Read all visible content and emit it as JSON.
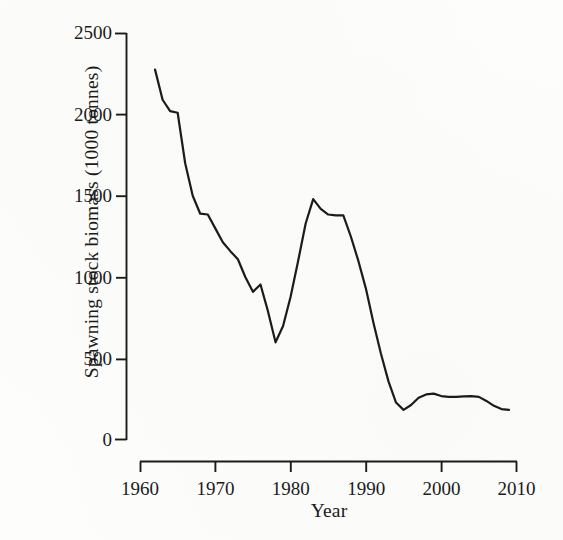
{
  "figure": {
    "background_color": "#fdfdfc",
    "ink_color": "#1b1b1b"
  },
  "axes": {
    "x": {
      "label": "Year",
      "ticks": [
        "1960",
        "1970",
        "1980",
        "1990",
        "2000",
        "2010"
      ],
      "tick_values": [
        1960,
        1970,
        1980,
        1990,
        2000,
        2010
      ],
      "range": [
        1960,
        2010
      ]
    },
    "y": {
      "label": "Spawning stock biomass (1000 tonnes)",
      "ticks": [
        "0",
        "500",
        "1000",
        "1500",
        "2000",
        "2500"
      ],
      "tick_values": [
        0,
        500,
        1000,
        1500,
        2000,
        2500
      ],
      "range": [
        0,
        2500
      ]
    }
  },
  "chart_data": {
    "type": "line",
    "title": "",
    "xlabel": "Year",
    "ylabel": "Spawning stock biomass (1000 tonnes)",
    "xlim": [
      1960,
      2010
    ],
    "ylim": [
      0,
      2500
    ],
    "grid": false,
    "legend": false,
    "line_color": "#1b1b1b",
    "line_width": 2.2,
    "series": [
      {
        "name": "Spawning stock biomass",
        "x": [
          1962,
          1963,
          1964,
          1965,
          1966,
          1967,
          1968,
          1969,
          1970,
          1971,
          1972,
          1973,
          1974,
          1975,
          1976,
          1977,
          1978,
          1979,
          1980,
          1981,
          1982,
          1983,
          1984,
          1985,
          1986,
          1987,
          1988,
          1989,
          1990,
          1991,
          1992,
          1993,
          1994,
          1995,
          1996,
          1997,
          1998,
          1999,
          2000,
          2001,
          2002,
          2003,
          2004,
          2005,
          2006,
          2007,
          2008,
          2009
        ],
        "values": [
          2275,
          2090,
          2020,
          2010,
          1700,
          1500,
          1390,
          1385,
          1300,
          1215,
          1160,
          1110,
          1000,
          910,
          955,
          790,
          600,
          700,
          880,
          1100,
          1330,
          1480,
          1420,
          1385,
          1380,
          1380,
          1250,
          1100,
          930,
          720,
          530,
          360,
          230,
          185,
          215,
          260,
          280,
          285,
          270,
          265,
          265,
          268,
          270,
          265,
          240,
          210,
          190,
          185
        ]
      }
    ],
    "annotations": []
  }
}
